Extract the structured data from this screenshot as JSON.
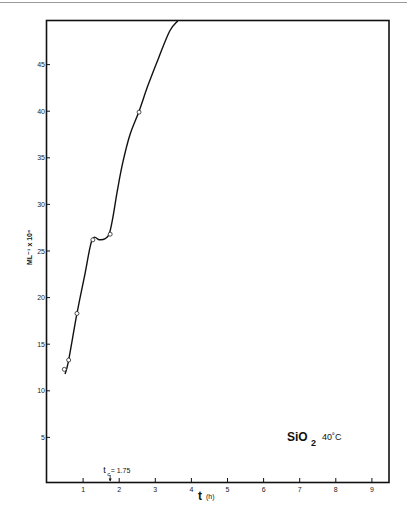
{
  "chart_data": {
    "type": "line",
    "title": "",
    "xlabel": "t",
    "xlabel_unit": "(h)",
    "ylabel": "ML⁻¹ x 10⁶",
    "xlim": [
      0,
      9.5
    ],
    "ylim": [
      0,
      50
    ],
    "grid": false,
    "x_ticks": [
      1,
      2,
      3,
      4,
      5,
      6,
      7,
      8,
      9
    ],
    "x_tick_labels": [
      "1",
      "2",
      "3",
      "4",
      "5",
      "6",
      "7",
      "8",
      "9"
    ],
    "y_ticks": [
      5,
      10,
      15,
      20,
      25,
      30,
      35,
      40,
      45
    ],
    "y_tick_labels": [
      "5",
      "10",
      "15",
      "20",
      "25",
      "30",
      "35",
      "40",
      "45"
    ],
    "series": [
      {
        "name": "fitted curve",
        "style": "line",
        "x": [
          0.5,
          0.6,
          0.83,
          1.05,
          1.25,
          1.45,
          1.6,
          1.72,
          1.82,
          1.95,
          2.1,
          2.3,
          2.55,
          2.8,
          3.1,
          3.4,
          3.62
        ],
        "y": [
          11.8,
          13.3,
          18.3,
          22.5,
          26.2,
          26.2,
          26.3,
          26.8,
          28.5,
          31.5,
          34.5,
          37.5,
          40.0,
          42.8,
          45.8,
          48.6,
          50.0
        ]
      },
      {
        "name": "measured points",
        "style": "markers",
        "marker": "open-circle",
        "x": [
          0.48,
          0.6,
          0.83,
          1.27,
          1.75,
          2.55
        ],
        "y": [
          12.3,
          13.3,
          18.3,
          26.2,
          26.8,
          39.9
        ]
      }
    ],
    "annotations": [
      {
        "text": "t",
        "subscript": "c",
        "suffix": " = 1.75",
        "x": 1.75,
        "type": "arrow-to-axis"
      }
    ],
    "legend_text": {
      "sample": "SiO",
      "sample_subscript": "2",
      "temperature": "40˚C"
    },
    "legend_placement": "bottom-right"
  }
}
